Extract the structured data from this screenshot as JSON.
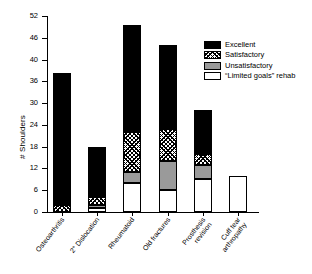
{
  "chart_data": {
    "type": "bar",
    "title": "",
    "xlabel": "",
    "ylabel": "# Shoulders",
    "ylim": [
      0,
      52
    ],
    "yticks": [
      0,
      6,
      12,
      18,
      24,
      30,
      36,
      40,
      46,
      52
    ],
    "ytick_labels": [
      "0",
      "6",
      "12",
      "18",
      "24",
      "30",
      "36",
      "40",
      "46",
      "52"
    ],
    "grid": false,
    "stacked": true,
    "legend_position": "upper right",
    "categories": [
      "Osteoarthritis",
      "2° Dislocation",
      "Rheumatoid",
      "Old fractures",
      "Prosthesis revision",
      "Cuff tear arthropathy"
    ],
    "category_lines": [
      [
        "Osteoarthritis"
      ],
      [
        "2° Dislocation"
      ],
      [
        "Rheumatoid"
      ],
      [
        "Old fractures"
      ],
      [
        "Prosthesis",
        "revision"
      ],
      [
        "Cuff tear",
        "arthropathy"
      ]
    ],
    "series": [
      {
        "name": "“Limited goals” rehab",
        "key": "limited",
        "color": "#ffffff",
        "values": [
          0,
          1,
          8,
          6,
          9,
          10
        ]
      },
      {
        "name": "Unsatisfactory",
        "key": "unsatisfactory",
        "color": "#9a9a9a",
        "values": [
          0,
          1,
          3,
          8,
          4,
          0
        ]
      },
      {
        "name": "Satisfactory",
        "key": "satisfactory",
        "color": "hatch",
        "values": [
          2,
          2,
          11,
          9,
          3,
          0
        ]
      },
      {
        "name": "Excellent",
        "key": "excellent",
        "color": "#000000",
        "values": [
          35.5,
          14,
          27.5,
          21,
          12,
          0
        ]
      }
    ],
    "totals": [
      37.5,
      18,
      49.5,
      44,
      28,
      10
    ]
  },
  "legend": {
    "items": [
      {
        "label": "Excellent",
        "key": "excellent"
      },
      {
        "label": "Satisfactory",
        "key": "satisfactory"
      },
      {
        "label": "Unsatisfactory",
        "key": "unsatisfactory"
      },
      {
        "label": "“Limited goals” rehab",
        "key": "limited"
      }
    ]
  },
  "axis": {
    "y_title": "# Shoulders",
    "y_tick_0": "0",
    "y_tick_1": "6",
    "y_tick_2": "12",
    "y_tick_3": "18",
    "y_tick_4": "24",
    "y_tick_5": "30",
    "y_tick_6": "36",
    "y_tick_7": "40",
    "y_tick_8": "46",
    "y_tick_9": "52"
  }
}
